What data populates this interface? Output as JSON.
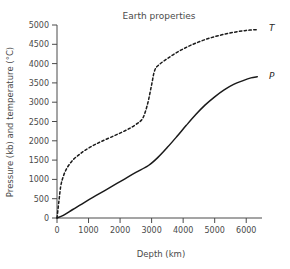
{
  "chart_data": {
    "type": "line",
    "title": "Earth properties",
    "xlabel": "Depth (km)",
    "ylabel": "Pressure (kb) and temperature (°C)",
    "xlim": [
      0,
      6500
    ],
    "ylim": [
      0,
      5000
    ],
    "xticks": [
      0,
      1000,
      2000,
      3000,
      4000,
      5000,
      6000
    ],
    "xtick_labels": [
      "0",
      "1000",
      "2000",
      "3000",
      "4000",
      "5000",
      "6000"
    ],
    "yticks": [
      0,
      500,
      1000,
      1500,
      2000,
      2500,
      3000,
      3500,
      4000,
      4500,
      5000
    ],
    "ytick_labels": [
      "0",
      "500",
      "1000",
      "1500",
      "2000",
      "2500",
      "3000",
      "3500",
      "4000",
      "4500",
      "5000"
    ],
    "grid": false,
    "legend_position": "inline-right-end",
    "series": [
      {
        "name": "T",
        "label": "T",
        "style": "dashed",
        "color": "#1a1a1a",
        "units": "°C",
        "x": [
          0,
          60,
          120,
          200,
          320,
          500,
          700,
          900,
          1150,
          1400,
          1700,
          2000,
          2300,
          2550,
          2700,
          2800,
          2900,
          3000,
          3100,
          3250,
          3500,
          3800,
          4100,
          4400,
          4800,
          5200,
          5600,
          6000,
          6350
        ],
        "y": [
          0,
          430,
          830,
          1080,
          1300,
          1500,
          1640,
          1760,
          1880,
          1980,
          2090,
          2200,
          2320,
          2450,
          2560,
          2750,
          3050,
          3450,
          3830,
          3980,
          4130,
          4290,
          4420,
          4530,
          4650,
          4740,
          4810,
          4860,
          4880
        ]
      },
      {
        "name": "P",
        "label": "P",
        "style": "solid",
        "color": "#1a1a1a",
        "units": "kb",
        "x": [
          0,
          200,
          500,
          900,
          1300,
          1700,
          2100,
          2500,
          2900,
          3200,
          3500,
          3800,
          4100,
          4400,
          4700,
          5000,
          5300,
          5600,
          5900,
          6150,
          6350
        ],
        "y": [
          0,
          70,
          220,
          420,
          610,
          800,
          990,
          1180,
          1360,
          1570,
          1830,
          2110,
          2400,
          2680,
          2930,
          3140,
          3320,
          3460,
          3560,
          3630,
          3660
        ]
      }
    ],
    "annotations": [
      {
        "text": "T",
        "x": 6400,
        "y": 4880
      },
      {
        "text": "P",
        "x": 6400,
        "y": 3660
      }
    ]
  },
  "figure": {
    "background_color": "#ffffff",
    "axis_color": "#4a4a4a",
    "line_color": "#1a1a1a"
  }
}
